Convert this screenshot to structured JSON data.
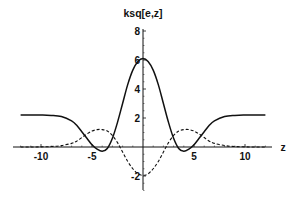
{
  "chart_data": {
    "type": "line",
    "title": "ksq[e,z]",
    "xlabel": "z",
    "ylabel": "ksq[e,z]",
    "xlim": [
      -12.8,
      12.6
    ],
    "ylim": [
      -3,
      8
    ],
    "grid": false,
    "legend": null,
    "x_ticks": [
      -10,
      -5,
      5,
      10
    ],
    "x_tick_labels": [
      "-10",
      "-5",
      "5",
      "10"
    ],
    "y_ticks": [
      -2,
      2,
      4,
      6,
      8
    ],
    "y_tick_labels": [
      "-2",
      "2",
      "4",
      "6",
      "8"
    ],
    "x": [
      -12,
      -11,
      -10,
      -9,
      -8,
      -7,
      -6.5,
      -6,
      -5.5,
      -5,
      -4.5,
      -4,
      -3.5,
      -3,
      -2.5,
      -2,
      -1.5,
      -1,
      -0.5,
      0,
      0.5,
      1,
      1.5,
      2,
      2.5,
      3,
      3.5,
      4,
      4.5,
      5,
      5.5,
      6,
      6.5,
      7,
      8,
      9,
      10,
      11,
      12
    ],
    "series": [
      {
        "name": "solid",
        "style": "solid",
        "values": [
          2.2,
          2.2,
          2.2,
          2.18,
          2.1,
          1.8,
          1.5,
          1.05,
          0.6,
          0.15,
          -0.15,
          -0.3,
          -0.1,
          0.6,
          1.7,
          3.0,
          4.3,
          5.3,
          5.9,
          6.1,
          5.9,
          5.3,
          4.3,
          3.0,
          1.7,
          0.6,
          -0.1,
          -0.3,
          -0.15,
          0.15,
          0.6,
          1.05,
          1.5,
          1.8,
          2.1,
          2.18,
          2.2,
          2.2,
          2.2
        ]
      },
      {
        "name": "dashed",
        "style": "dashed",
        "values": [
          0,
          0,
          0.01,
          0.03,
          0.1,
          0.25,
          0.4,
          0.65,
          0.9,
          1.1,
          1.2,
          1.2,
          1.1,
          0.8,
          0.3,
          -0.35,
          -1.0,
          -1.5,
          -1.85,
          -1.95,
          -1.85,
          -1.5,
          -1.0,
          -0.35,
          0.3,
          0.8,
          1.1,
          1.2,
          1.2,
          1.1,
          0.9,
          0.65,
          0.4,
          0.25,
          0.1,
          0.03,
          0.01,
          0,
          0
        ]
      }
    ]
  },
  "layout": {
    "origin_px": [
      143,
      147
    ],
    "x_px_per_unit": 10.2,
    "y_px_per_unit": 14.5,
    "x_axis_px": [
      13,
      272
    ],
    "y_axis_px": [
      29,
      190
    ]
  }
}
